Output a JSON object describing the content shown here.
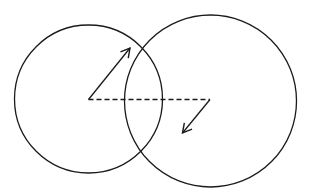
{
  "diagram": {
    "width": 310,
    "height": 192,
    "background": "#ffffff",
    "stroke_color": "#1a1a1a",
    "circles": [
      {
        "name": "left-circle",
        "cx": 88.5,
        "cy": 99,
        "r": 74
      },
      {
        "name": "right-circle",
        "cx": 210.5,
        "cy": 101,
        "r": 86
      }
    ],
    "dashed_line": {
      "x1": 88.5,
      "y1": 99.5,
      "x2": 210,
      "y2": 99.5
    },
    "arrows": [
      {
        "name": "radius-arrow-left",
        "x1": 88.5,
        "y1": 99.5,
        "x2": 130,
        "y2": 48
      },
      {
        "name": "radius-arrow-right",
        "x1": 210,
        "y1": 99.5,
        "x2": 182.5,
        "y2": 133
      }
    ]
  }
}
